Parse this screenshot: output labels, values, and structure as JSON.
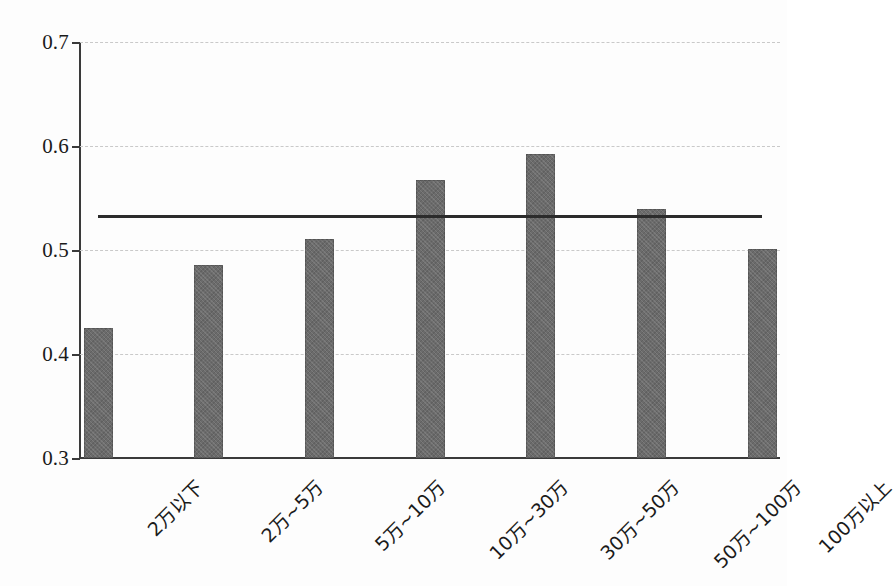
{
  "chart_data": {
    "type": "bar",
    "title": "",
    "subtitle": "",
    "xlabel": "",
    "ylabel": "",
    "categories": [
      "2万以下",
      "2万~5万",
      "5万~10万",
      "10万~30万",
      "30万~50万",
      "50万~100万",
      "100万以上"
    ],
    "values": [
      0.425,
      0.486,
      0.511,
      0.567,
      0.592,
      0.539,
      0.501
    ],
    "series": [
      {
        "name": "比例",
        "values": [
          0.425,
          0.486,
          0.511,
          0.567,
          0.592,
          0.539,
          0.501
        ],
        "color": "#6b6b6b"
      }
    ],
    "reference_line": {
      "name": "平均值",
      "value": 0.532,
      "color": "#2b2b2b",
      "orientation": "horizontal",
      "x_start_category": "2万以下",
      "x_end_category": "100万以上"
    },
    "ylim": [
      0.3,
      0.7
    ],
    "ytick_labels": [
      "0.7",
      "0.6",
      "0.5",
      "0.4",
      "0.3"
    ],
    "ytick_values": [
      0.7,
      0.6,
      0.5,
      0.4,
      0.3
    ],
    "grid": true,
    "grid_style": "dashed",
    "grid_color": "#c9c9c9",
    "legend": false,
    "legend_position": "none",
    "background_color": "#fdfdfd",
    "axis_color": "#3a3a3a"
  }
}
